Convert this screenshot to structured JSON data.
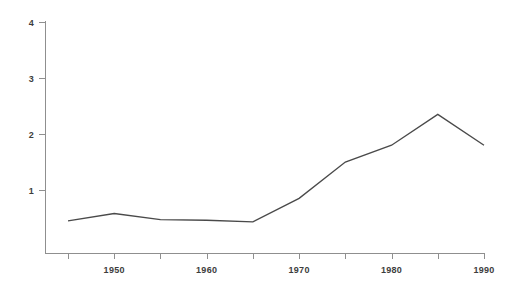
{
  "chart_data": {
    "type": "line",
    "title": "",
    "subtitle": "",
    "xlabel": "",
    "ylabel": "",
    "xlim": [
      1945,
      1990
    ],
    "ylim": [
      -0.125,
      4
    ],
    "grid": false,
    "legend": null,
    "background_color": "#ffffff",
    "line_color": "#4a4a4a",
    "axis_color": "#8f8f8f",
    "label_color": "#3d3d3d",
    "x": [
      1945,
      1950,
      1955,
      1960,
      1965,
      1970,
      1975,
      1980,
      1985,
      1990
    ],
    "values": [
      0.45,
      0.58,
      0.47,
      0.46,
      0.43,
      0.85,
      1.5,
      1.8,
      2.35,
      1.8
    ],
    "series": [
      {
        "name": "series-1",
        "x": [
          1945,
          1950,
          1955,
          1960,
          1965,
          1970,
          1975,
          1980,
          1985,
          1990
        ],
        "values": [
          0.45,
          0.58,
          0.47,
          0.46,
          0.43,
          0.85,
          1.5,
          1.8,
          2.35,
          1.8
        ]
      }
    ],
    "y_axis": {
      "ticks": [
        1,
        2,
        3,
        4
      ],
      "tick_labels": [
        "1",
        "2",
        "3",
        "4"
      ]
    },
    "x_axis": {
      "ticks": [
        1945,
        1950,
        1955,
        1960,
        1965,
        1970,
        1975,
        1980,
        1985,
        1990
      ],
      "labeled_ticks": [
        1950,
        1960,
        1970,
        1980,
        1990
      ],
      "tick_labels": [
        "1950",
        "1960",
        "1970",
        "1980",
        "1990"
      ]
    }
  }
}
